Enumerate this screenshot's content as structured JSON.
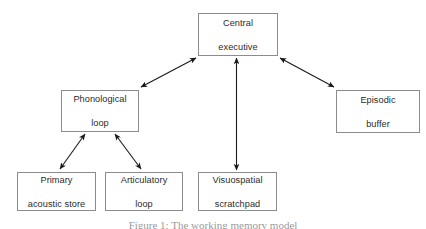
{
  "figure": {
    "title": "Working memory model",
    "caption": "Figure 1: The working memory model",
    "box_border_color": "#8c8c8c",
    "arrow_color": "#1a1a1a",
    "text_color": "#2b2b2b",
    "background_color": "#ffffff"
  },
  "nodes": [
    {
      "id": "central",
      "line1": "Central",
      "line2": "executive"
    },
    {
      "id": "phonological",
      "line1": "Phonological",
      "line2": "loop"
    },
    {
      "id": "episodic",
      "line1": "Episodic",
      "line2": "buffer"
    },
    {
      "id": "primary",
      "line1": "Primary",
      "line2": "acoustic store"
    },
    {
      "id": "articulatory",
      "line1": "Articulatory",
      "line2": "loop"
    },
    {
      "id": "visuospatial",
      "line1": "Visuospatial",
      "line2": "scratchpad"
    }
  ],
  "edges": [
    {
      "from": "central",
      "to": "phonological",
      "style": "double-headed"
    },
    {
      "from": "central",
      "to": "episodic",
      "style": "double-headed"
    },
    {
      "from": "central",
      "to": "visuospatial",
      "style": "double-headed"
    },
    {
      "from": "phonological",
      "to": "primary",
      "style": "double-headed"
    },
    {
      "from": "phonological",
      "to": "articulatory",
      "style": "double-headed"
    }
  ]
}
